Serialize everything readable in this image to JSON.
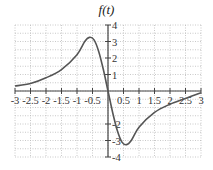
{
  "chart_data": {
    "type": "line",
    "title": "f(t)",
    "xlabel": "",
    "ylabel": "",
    "xlim": [
      -3,
      3
    ],
    "ylim": [
      -4,
      4
    ],
    "grid": true,
    "x_ticks": [
      "-3",
      "-2.5",
      "-2",
      "-1.5",
      "-1",
      "-0.5",
      "0.5",
      "1",
      "1.5",
      "2",
      "2.5",
      "3"
    ],
    "y_ticks": [
      "4",
      "3",
      "2",
      "1",
      "-2",
      "-3",
      "-4"
    ],
    "series": [
      {
        "name": "f(t)",
        "x": [
          -3,
          -2.5,
          -2,
          -1.5,
          -1,
          -0.75,
          -0.6,
          -0.45,
          -0.3,
          -0.15,
          0,
          0.15,
          0.3,
          0.45,
          0.6,
          0.75,
          1,
          1.5,
          2,
          2.5,
          3
        ],
        "values": [
          0.3,
          0.45,
          0.8,
          1.3,
          2.2,
          3.0,
          3.25,
          3.1,
          2.4,
          1.3,
          0,
          -1.3,
          -2.4,
          -3.1,
          -3.25,
          -3.0,
          -2.2,
          -1.3,
          -0.8,
          -0.45,
          -0.1
        ]
      }
    ]
  }
}
